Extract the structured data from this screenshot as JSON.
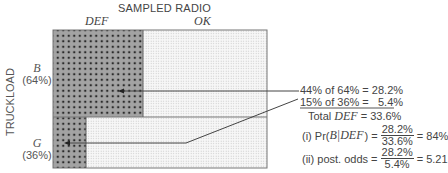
{
  "diagram": {
    "title": "SAMPLED RADIO",
    "columns": [
      {
        "label": "DEF"
      },
      {
        "label": "OK"
      }
    ],
    "y_axis_label": "TRUCKLOAD",
    "rows": [
      {
        "label": "B",
        "share": "(64%)",
        "def_fraction": 0.44
      },
      {
        "label": "G",
        "share": "(36%)",
        "def_fraction": 0.15
      }
    ],
    "calculations": {
      "line1": "44% of 64% = 28.2%",
      "line2": "15% of 36% =   5.4%",
      "total_prefix": "Total",
      "total_var": "DEF",
      "total_suffix": "= 33.6%",
      "pr_label_prefix": "(i) Pr(",
      "pr_label_var": "B|DEF",
      "pr_label_suffix": ") =",
      "pr_num": "28.2%",
      "pr_den": "33.6%",
      "pr_result": "= 84%",
      "odds_label": "(ii) post. odds =",
      "odds_num": "28.2%",
      "odds_den": "5.4%",
      "odds_result": "= 5.21"
    },
    "colors": {
      "def_fill": "#9a9a9a",
      "ok_fill": "#f2f2f2",
      "line": "#444444"
    }
  }
}
